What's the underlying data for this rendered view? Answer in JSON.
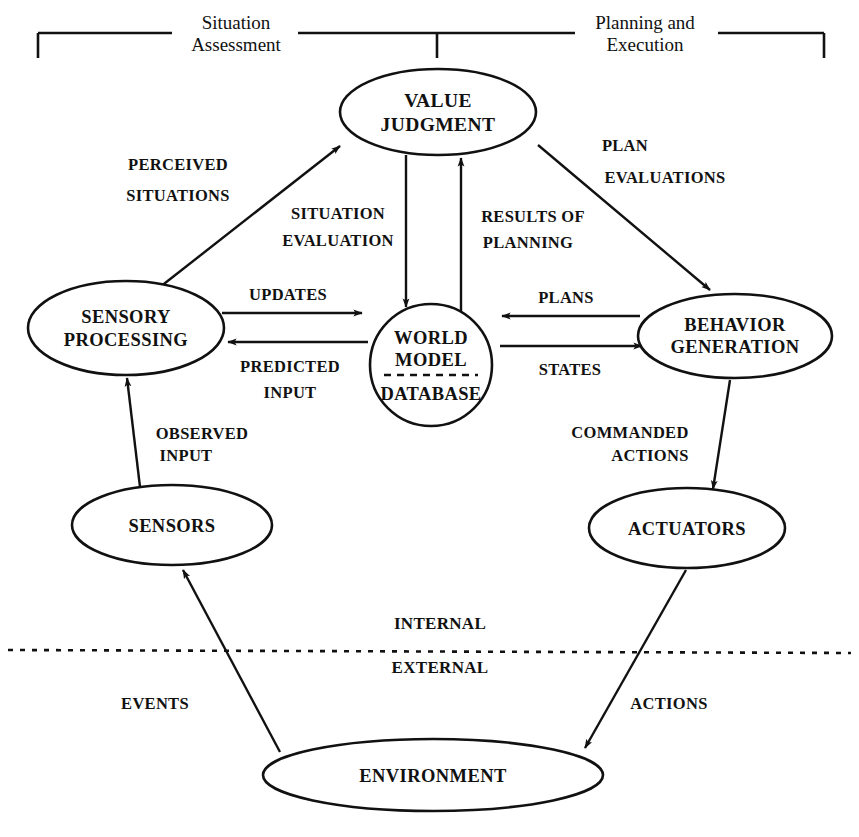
{
  "figure": {
    "kind": "block-diagram",
    "background_color": "#ffffff",
    "line_color": "#111111"
  },
  "brackets": {
    "left": {
      "label_line1": "Situation",
      "label_line2": "Assessment"
    },
    "right": {
      "label_line1": "Planning and",
      "label_line2": "Execution"
    }
  },
  "nodes": {
    "value_judgment": {
      "line1": "VALUE",
      "line2": "JUDGMENT"
    },
    "sensory_processing": {
      "line1": "SENSORY",
      "line2": "PROCESSING"
    },
    "world_model": {
      "line1": "WORLD",
      "line2": "MODEL",
      "line3": "DATABASE"
    },
    "behavior_generation": {
      "line1": "BEHAVIOR",
      "line2": "GENERATION"
    },
    "sensors": {
      "line1": "SENSORS"
    },
    "actuators": {
      "line1": "ACTUATORS"
    },
    "environment": {
      "line1": "ENVIRONMENT"
    }
  },
  "edges": {
    "perceived_situations": {
      "line1": "PERCEIVED",
      "line2": "SITUATIONS"
    },
    "plan_evaluations": {
      "line1": "PLAN",
      "line2": "EVALUATIONS"
    },
    "situation_evaluation": {
      "line1": "SITUATION",
      "line2": "EVALUATION"
    },
    "results_of_planning": {
      "line1": "RESULTS OF",
      "line2": "PLANNING"
    },
    "updates": {
      "line1": "UPDATES"
    },
    "predicted_input": {
      "line1": "PREDICTED",
      "line2": "INPUT"
    },
    "plans": {
      "line1": "PLANS"
    },
    "states": {
      "line1": "STATES"
    },
    "observed_input": {
      "line1": "OBSERVED",
      "line2": "INPUT"
    },
    "commanded_actions": {
      "line1": "COMMANDED",
      "line2": "ACTIONS"
    },
    "events": {
      "line1": "EVENTS"
    },
    "actions": {
      "line1": "ACTIONS"
    }
  },
  "divider": {
    "above": "INTERNAL",
    "below": "EXTERNAL"
  }
}
